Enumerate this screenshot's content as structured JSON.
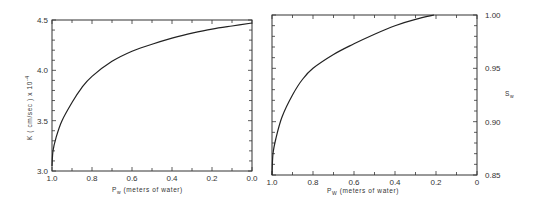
{
  "chart_data": [
    {
      "type": "line",
      "title": "",
      "xlabel": "P_w (meters of water)",
      "ylabel": "K (cm/sec) x 10^-4",
      "xlim": [
        1.0,
        0.0
      ],
      "ylim": [
        3.0,
        4.5
      ],
      "x_ticks": [
        "1.0",
        "0.8",
        "0.6",
        "0.4",
        "0.2",
        "0.0"
      ],
      "y_ticks": [
        "3.0",
        "3.5",
        "4.0",
        "4.5"
      ],
      "grid": false,
      "x": [
        1.0,
        0.995,
        0.98,
        0.95,
        0.9,
        0.85,
        0.8,
        0.7,
        0.6,
        0.5,
        0.4,
        0.3,
        0.2,
        0.1,
        0.0
      ],
      "series": [
        {
          "name": "K",
          "values": [
            3.05,
            3.2,
            3.33,
            3.5,
            3.68,
            3.83,
            3.94,
            4.09,
            4.19,
            4.26,
            4.32,
            4.37,
            4.41,
            4.44,
            4.47
          ]
        }
      ]
    },
    {
      "type": "line",
      "title": "",
      "xlabel": "P_W (meters of water)",
      "ylabel": "S_w",
      "y_axis_side": "right",
      "xlim": [
        1.0,
        0.0
      ],
      "ylim": [
        0.85,
        1.0
      ],
      "x_ticks": [
        "1.0",
        "0.8",
        "0.6",
        "0.4",
        "0.2",
        "0"
      ],
      "y_ticks": [
        "0.85",
        "0.90",
        "0.95",
        "1.00"
      ],
      "grid": false,
      "x": [
        1.0,
        0.995,
        0.98,
        0.95,
        0.9,
        0.85,
        0.8,
        0.7,
        0.6,
        0.5,
        0.4,
        0.3,
        0.21
      ],
      "series": [
        {
          "name": "S_w",
          "values": [
            0.85,
            0.87,
            0.885,
            0.905,
            0.925,
            0.94,
            0.95,
            0.963,
            0.973,
            0.982,
            0.99,
            0.996,
            1.0
          ]
        }
      ]
    }
  ],
  "labels": {
    "left_ylabel_main": "K  ( cm/sec ) x 10",
    "left_ylabel_exp": "-4",
    "left_xlabel_p": "P",
    "left_xlabel_sub": "w",
    "left_xlabel_rest": " (meters of water)",
    "right_xlabel_p": "P",
    "right_xlabel_sub": "W",
    "right_xlabel_rest": " (meters of water)",
    "right_ylabel_s": "S",
    "right_ylabel_sub": "w"
  }
}
